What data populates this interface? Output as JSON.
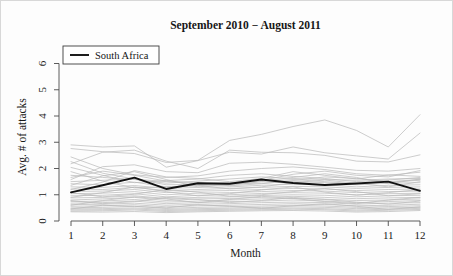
{
  "figure": {
    "title": "September 2010 − August 2011",
    "legend": {
      "entries": [
        {
          "label": "South Africa",
          "color": "#111111",
          "style": "bold-line"
        }
      ]
    }
  },
  "chart_data": {
    "type": "line",
    "title": "September 2010 − August 2011",
    "xlabel": "Month",
    "ylabel": "Avg. # of attacks",
    "xlim": [
      1,
      12
    ],
    "ylim": [
      0,
      6.4
    ],
    "xticks": [
      1,
      2,
      3,
      4,
      5,
      6,
      7,
      8,
      9,
      10,
      11,
      12
    ],
    "xtick_labels": [
      "1",
      "2",
      "3",
      "4",
      "5",
      "6",
      "7",
      "8",
      "9",
      "10",
      "11",
      "12"
    ],
    "yticks": [
      0,
      1,
      2,
      3,
      4,
      5,
      6
    ],
    "ytick_labels": [
      "0",
      "1",
      "2",
      "3",
      "4",
      "5",
      "6"
    ],
    "grid": false,
    "legend_position": "top-left",
    "x": [
      1,
      2,
      3,
      4,
      5,
      6,
      7,
      8,
      9,
      10,
      11,
      12
    ],
    "highlight_series": {
      "name": "South Africa",
      "color": "#111111",
      "values": [
        1.09,
        1.36,
        1.65,
        1.22,
        1.44,
        1.42,
        1.58,
        1.45,
        1.37,
        1.43,
        1.5,
        1.15
      ]
    },
    "background_series_color": "#b9b9b9",
    "background_series_note": "Unlabeled light-gray country trajectories plotted behind the highlighted South Africa line",
    "series": [
      {
        "name": "bg-01",
        "values": [
          2.9,
          2.82,
          2.86,
          2.05,
          2.3,
          2.62,
          2.55,
          2.82,
          2.6,
          2.48,
          2.36,
          3.35
        ]
      },
      {
        "name": "bg-02",
        "values": [
          2.76,
          2.64,
          2.57,
          2.23,
          2.31,
          3.07,
          3.3,
          3.6,
          3.85,
          3.45,
          2.82,
          4.05
        ]
      },
      {
        "name": "bg-03",
        "values": [
          2.18,
          2.62,
          2.7,
          2.28,
          2.0,
          2.7,
          2.62,
          2.6,
          2.5,
          2.28,
          2.25,
          2.52
        ]
      },
      {
        "name": "bg-04",
        "values": [
          1.58,
          2.07,
          2.14,
          1.88,
          1.84,
          2.2,
          2.24,
          2.16,
          2.05,
          1.93,
          1.9,
          2.0
        ]
      },
      {
        "name": "bg-05",
        "values": [
          2.26,
          1.82,
          1.6,
          1.5,
          1.42,
          1.46,
          1.55,
          1.78,
          1.9,
          1.74,
          1.68,
          1.92
        ]
      },
      {
        "name": "bg-06",
        "values": [
          1.2,
          1.48,
          1.92,
          1.68,
          1.62,
          1.5,
          1.62,
          1.88,
          1.74,
          1.6,
          1.76,
          1.7
        ]
      },
      {
        "name": "bg-07",
        "values": [
          1.74,
          1.66,
          1.58,
          1.44,
          1.52,
          1.6,
          1.68,
          1.62,
          1.58,
          1.55,
          1.6,
          1.62
        ]
      },
      {
        "name": "bg-08",
        "values": [
          1.5,
          1.55,
          1.6,
          1.38,
          1.4,
          1.36,
          1.5,
          1.58,
          1.5,
          1.42,
          1.48,
          1.55
        ]
      },
      {
        "name": "bg-09",
        "values": [
          1.42,
          1.38,
          1.48,
          1.3,
          1.34,
          1.42,
          1.44,
          1.5,
          1.46,
          1.38,
          1.44,
          1.46
        ]
      },
      {
        "name": "bg-10",
        "values": [
          1.3,
          1.28,
          1.35,
          1.24,
          1.28,
          1.3,
          1.36,
          1.4,
          1.38,
          1.3,
          1.36,
          1.38
        ]
      },
      {
        "name": "bg-11",
        "values": [
          1.22,
          1.2,
          1.28,
          1.16,
          1.2,
          1.24,
          1.28,
          1.32,
          1.3,
          1.24,
          1.28,
          1.3
        ]
      },
      {
        "name": "bg-12",
        "values": [
          1.12,
          1.14,
          1.2,
          1.08,
          1.14,
          1.16,
          1.2,
          1.24,
          1.22,
          1.16,
          1.2,
          1.22
        ]
      },
      {
        "name": "bg-13",
        "values": [
          1.04,
          1.06,
          1.12,
          1.0,
          1.06,
          1.08,
          1.12,
          1.16,
          1.14,
          1.08,
          1.12,
          1.14
        ]
      },
      {
        "name": "bg-14",
        "values": [
          0.96,
          0.98,
          1.04,
          0.92,
          0.98,
          1.0,
          1.05,
          1.08,
          1.06,
          1.0,
          1.04,
          1.06
        ]
      },
      {
        "name": "bg-15",
        "values": [
          0.88,
          0.9,
          0.96,
          0.86,
          0.9,
          0.92,
          0.97,
          1.0,
          0.98,
          0.92,
          0.96,
          0.98
        ]
      },
      {
        "name": "bg-16",
        "values": [
          0.8,
          0.84,
          0.9,
          0.78,
          0.84,
          0.86,
          0.9,
          0.94,
          0.9,
          0.85,
          0.88,
          0.9
        ]
      },
      {
        "name": "bg-17",
        "values": [
          0.74,
          0.76,
          0.82,
          0.72,
          0.76,
          0.8,
          0.84,
          0.86,
          0.83,
          0.78,
          0.8,
          0.84
        ]
      },
      {
        "name": "bg-18",
        "values": [
          0.68,
          0.7,
          0.76,
          0.66,
          0.7,
          0.74,
          0.76,
          0.8,
          0.76,
          0.7,
          0.74,
          0.78
        ]
      },
      {
        "name": "bg-19",
        "values": [
          0.62,
          0.64,
          0.68,
          0.6,
          0.64,
          0.66,
          0.7,
          0.72,
          0.7,
          0.64,
          0.68,
          0.7
        ]
      },
      {
        "name": "bg-20",
        "values": [
          0.56,
          0.58,
          0.62,
          0.54,
          0.58,
          0.6,
          0.63,
          0.66,
          0.63,
          0.58,
          0.6,
          0.64
        ]
      },
      {
        "name": "bg-21",
        "values": [
          0.5,
          0.52,
          0.56,
          0.48,
          0.52,
          0.54,
          0.57,
          0.6,
          0.57,
          0.52,
          0.55,
          0.58
        ]
      },
      {
        "name": "bg-22",
        "values": [
          0.46,
          0.47,
          0.5,
          0.44,
          0.47,
          0.49,
          0.52,
          0.54,
          0.52,
          0.47,
          0.5,
          0.52
        ]
      },
      {
        "name": "bg-23",
        "values": [
          0.42,
          0.43,
          0.46,
          0.4,
          0.43,
          0.45,
          0.47,
          0.49,
          0.47,
          0.42,
          0.45,
          0.48
        ]
      },
      {
        "name": "bg-24",
        "values": [
          0.38,
          0.39,
          0.42,
          0.36,
          0.39,
          0.41,
          0.43,
          0.45,
          0.43,
          0.38,
          0.41,
          0.44
        ]
      },
      {
        "name": "bg-25",
        "values": [
          0.35,
          0.34,
          0.36,
          0.32,
          0.35,
          0.37,
          0.39,
          0.4,
          0.38,
          0.34,
          0.36,
          0.4
        ]
      },
      {
        "name": "bg-26",
        "values": [
          1.88,
          1.52,
          1.26,
          1.3,
          1.36,
          1.22,
          1.3,
          1.46,
          1.56,
          1.44,
          1.3,
          1.5
        ]
      },
      {
        "name": "bg-27",
        "values": [
          2.04,
          1.74,
          1.46,
          1.54,
          1.6,
          1.74,
          1.8,
          1.7,
          1.62,
          1.5,
          1.56,
          1.66
        ]
      },
      {
        "name": "bg-28",
        "values": [
          1.66,
          1.9,
          1.74,
          1.52,
          1.46,
          1.34,
          1.42,
          1.54,
          1.68,
          1.62,
          1.5,
          1.58
        ]
      },
      {
        "name": "bg-29",
        "values": [
          0.9,
          1.08,
          1.3,
          1.12,
          0.96,
          1.04,
          1.18,
          1.3,
          1.1,
          0.98,
          1.08,
          1.2
        ]
      },
      {
        "name": "bg-30",
        "values": [
          1.08,
          0.92,
          1.02,
          1.2,
          1.1,
          0.94,
          1.0,
          1.12,
          1.24,
          1.12,
          0.96,
          1.04
        ]
      },
      {
        "name": "bg-31",
        "values": [
          0.6,
          0.78,
          0.92,
          0.84,
          0.7,
          0.82,
          0.94,
          0.86,
          0.74,
          0.66,
          0.8,
          0.9
        ]
      },
      {
        "name": "bg-32",
        "values": [
          0.78,
          0.66,
          0.74,
          0.9,
          0.82,
          0.7,
          0.78,
          0.9,
          0.82,
          0.72,
          0.64,
          0.76
        ]
      },
      {
        "name": "bg-33",
        "values": [
          2.44,
          2.0,
          1.76,
          1.66,
          1.72,
          1.9,
          2.0,
          2.06,
          1.96,
          1.8,
          1.74,
          1.86
        ]
      },
      {
        "name": "bg-34",
        "values": [
          1.36,
          1.72,
          1.88,
          1.58,
          1.3,
          1.4,
          1.52,
          1.66,
          1.8,
          1.66,
          1.42,
          1.6
        ]
      },
      {
        "name": "bg-35",
        "values": [
          0.46,
          0.6,
          0.56,
          0.5,
          0.62,
          0.56,
          0.48,
          0.58,
          0.66,
          0.56,
          0.44,
          0.54
        ]
      }
    ]
  }
}
